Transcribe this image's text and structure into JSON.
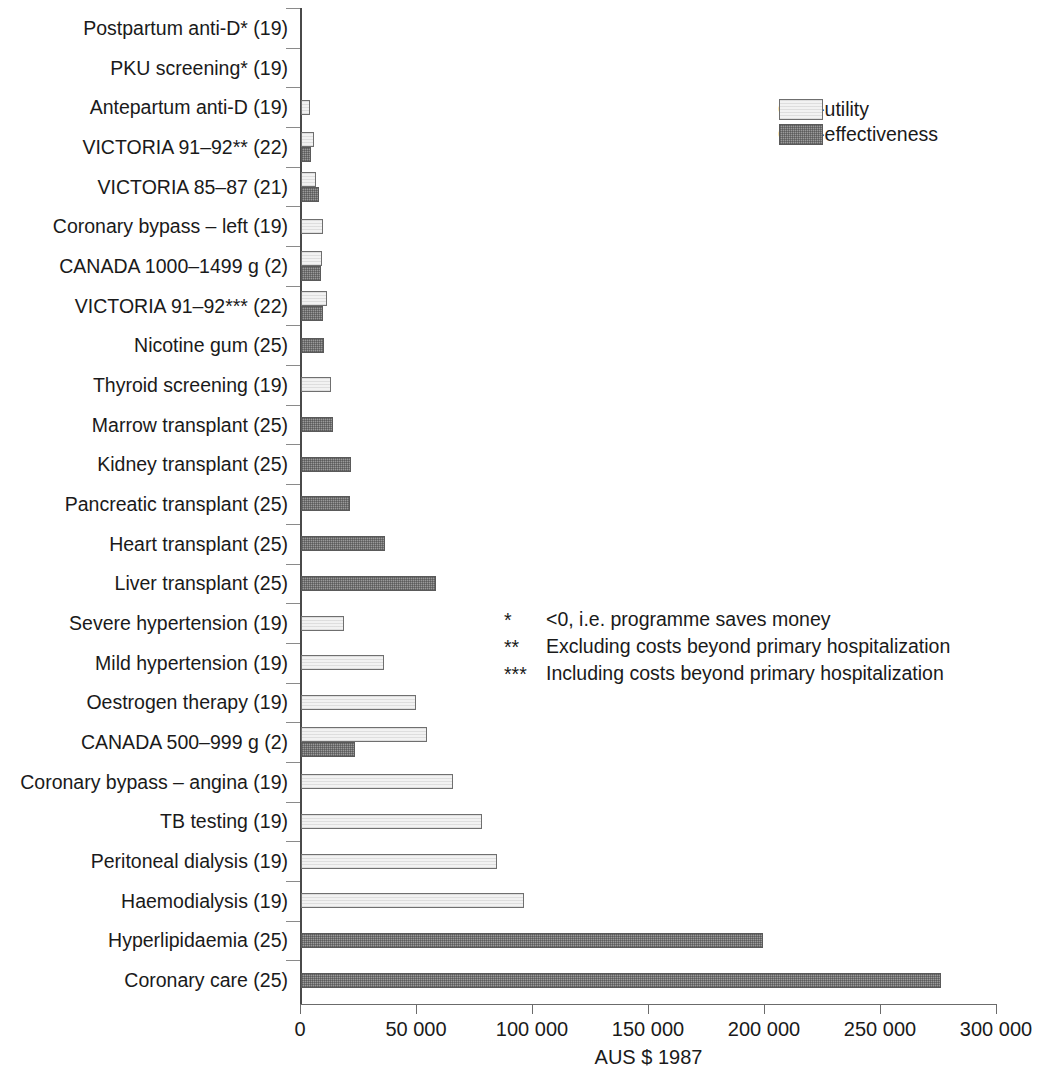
{
  "chart_data": {
    "type": "bar",
    "orientation": "horizontal",
    "title": "",
    "xlabel": "AUS $ 1987",
    "ylabel": "",
    "xlim": [
      0,
      300000
    ],
    "xticks": [
      0,
      50000,
      100000,
      150000,
      200000,
      250000,
      300000
    ],
    "xticklabels": [
      "0",
      "50 000",
      "100 000",
      "150 000",
      "200 000",
      "250 000",
      "300 000"
    ],
    "grid": false,
    "legend_position": "top-right",
    "legend": [
      "Cost-utility",
      "Cost-effectiveness"
    ],
    "categories": [
      "Postpartum anti-D* (19)",
      "PKU screening* (19)",
      "Antepartum anti-D (19)",
      "VICTORIA 91–92** (22)",
      "VICTORIA 85–87 (21)",
      "Coronary bypass – left (19)",
      "CANADA 1000–1499 g (2)",
      "VICTORIA 91–92*** (22)",
      "Nicotine gum (25)",
      "Thyroid screening (19)",
      "Marrow transplant (25)",
      "Kidney transplant (25)",
      "Pancreatic transplant (25)",
      "Heart transplant (25)",
      "Liver transplant (25)",
      "Severe hypertension (19)",
      "Mild hypertension (19)",
      "Oestrogen therapy (19)",
      "CANADA 500–999 g (2)",
      "Coronary bypass – angina (19)",
      "TB testing (19)",
      "Peritoneal dialysis (19)",
      "Haemodialysis (19)",
      "Hyperlipidaemia (25)",
      "Coronary care (25)"
    ],
    "series": [
      {
        "name": "Cost-utility",
        "color": "#f2f2f2",
        "values": [
          0,
          0,
          3700,
          5800,
          6400,
          9500,
          9100,
          11300,
          0,
          12800,
          0,
          0,
          0,
          0,
          0,
          18700,
          35900,
          49600,
          54300,
          65400,
          78000,
          84500,
          96000,
          0,
          0
        ]
      },
      {
        "name": "Cost-effectiveness",
        "color": "#9a9a9a",
        "values": [
          0,
          0,
          0,
          4200,
          7600,
          0,
          8600,
          9500,
          10100,
          0,
          13700,
          21700,
          21300,
          36300,
          58300,
          0,
          0,
          0,
          23400,
          0,
          0,
          0,
          0,
          199000,
          276000
        ]
      }
    ],
    "footnotes": [
      {
        "mark": "*",
        "text": "<0, i.e. programme saves money"
      },
      {
        "mark": "**",
        "text": "Excluding costs beyond primary hospitalization"
      },
      {
        "mark": "***",
        "text": "Including costs beyond primary hospitalization"
      }
    ]
  }
}
